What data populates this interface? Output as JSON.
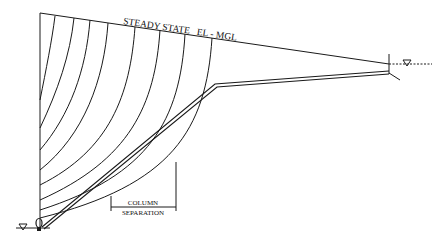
{
  "diagram": {
    "title_label": "STEADY STATE   EL - MGL",
    "column_separation": {
      "line1": "COLUMN",
      "line2": "SEPARATION"
    },
    "symbols": {
      "upstream_reservoir": "water-level-triangle",
      "downstream_valve": "valve-symbol"
    },
    "colors": {
      "line": "#1a1a1a",
      "background": "#ffffff"
    }
  }
}
